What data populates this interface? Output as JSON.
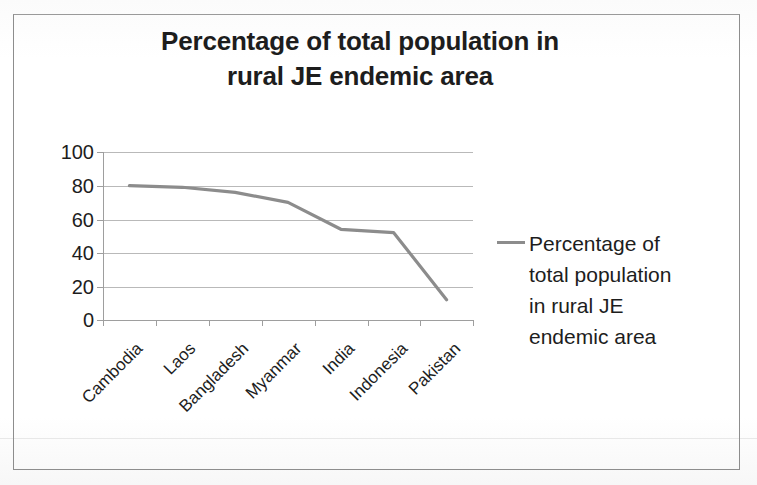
{
  "page": {
    "background_color": "#ffffff",
    "frame_border_color": "#8d8d8d"
  },
  "chart_data": {
    "type": "line",
    "title": "Percentage of total population in rural JE endemic area",
    "title_line1": "Percentage of total population in",
    "title_line2": "rural JE endemic area",
    "xlabel": "",
    "ylabel": "",
    "categories": [
      "Cambodia",
      "Laos",
      "Bangladesh",
      "Myanmar",
      "India",
      "Indonesia",
      "Pakistan"
    ],
    "values": [
      80,
      79,
      76,
      70,
      54,
      52,
      12
    ],
    "series": [
      {
        "name": "Percentage of total population in rural JE endemic area",
        "values": [
          80,
          79,
          76,
          70,
          54,
          52,
          12
        ],
        "color": "#8c8c8c"
      }
    ],
    "ylim": [
      0,
      100
    ],
    "yticks": [
      100,
      80,
      60,
      40,
      20,
      0
    ],
    "ytick_labels": [
      "100",
      "80",
      "60",
      "40",
      "20",
      "0"
    ],
    "grid": true,
    "grid_axis": "y",
    "legend": {
      "position": "right",
      "entries": [
        {
          "label": "Percentage of total population in rural JE endemic area",
          "line1": "Percentage of",
          "line2": "total population",
          "line3": "in rural JE",
          "line4": "endemic area",
          "swatch_color": "#8c8c8c",
          "marker": "line"
        }
      ]
    },
    "line_color": "#8c8c8c",
    "grid_color": "#b9b9b9",
    "axis_color": "#9e9e9e",
    "text_color": "#1d1d1d"
  }
}
